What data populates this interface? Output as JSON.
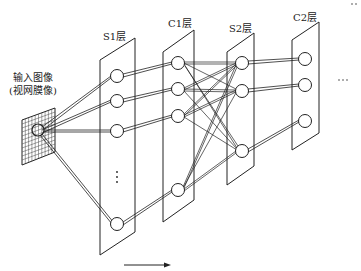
{
  "diagram": {
    "input": {
      "label_line1": "输入图像",
      "label_line2": "(视网膜像)"
    },
    "layers": [
      {
        "id": "S1",
        "label": "S1层",
        "node_count_visible": 4,
        "ellipsis": "⋮"
      },
      {
        "id": "C1",
        "label": "C1层",
        "node_count_visible": 4
      },
      {
        "id": "S2",
        "label": "S2层",
        "node_count_visible": 3
      },
      {
        "id": "C2",
        "label": "C2层",
        "node_count_visible": 3
      }
    ],
    "continuation_mid": "···",
    "continuation_top": "··",
    "flow_direction": "left-to-right",
    "colors": {
      "stroke": "#222222",
      "background": "#ffffff"
    }
  }
}
